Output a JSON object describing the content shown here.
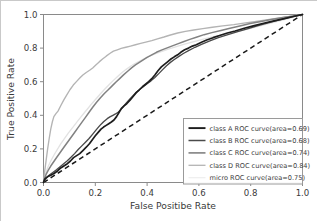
{
  "chart_data": {
    "type": "line",
    "title": "",
    "xlabel": "False Positibe Rate",
    "ylabel": "True Positive Rate",
    "xlim": [
      0.0,
      1.0
    ],
    "ylim": [
      0.0,
      1.0
    ],
    "xticks": [
      "0.0",
      "0.2",
      "0.4",
      "0.6",
      "0.8",
      "1.0"
    ],
    "yticks": [
      "0.0",
      "0.2",
      "0.4",
      "0.6",
      "0.8",
      "1.0"
    ],
    "xtick_values": [
      0.0,
      0.2,
      0.4,
      0.6,
      0.8,
      1.0
    ],
    "ytick_values": [
      0.0,
      0.2,
      0.4,
      0.6,
      0.8,
      1.0
    ],
    "grid": false,
    "legend_position": "lower right",
    "reference_line": {
      "name": "chance-diagonal",
      "style": "dashed",
      "color": "#1a1a1a",
      "x": [
        0.0,
        1.0
      ],
      "y": [
        0.0,
        1.0
      ]
    },
    "series": [
      {
        "name": "class A ROC curve",
        "area": 0.69,
        "color": "#1d1d1d",
        "width": 1.7,
        "x": [
          0.0,
          0.005,
          0.012,
          0.02,
          0.03,
          0.042,
          0.055,
          0.068,
          0.08,
          0.092,
          0.104,
          0.116,
          0.128,
          0.14,
          0.152,
          0.165,
          0.178,
          0.19,
          0.2,
          0.212,
          0.222,
          0.232,
          0.242,
          0.252,
          0.262,
          0.272,
          0.282,
          0.292,
          0.3,
          0.31,
          0.322,
          0.334,
          0.346,
          0.358,
          0.37,
          0.382,
          0.394,
          0.406,
          0.418,
          0.43,
          0.442,
          0.455,
          0.468,
          0.48,
          0.492,
          0.505,
          0.518,
          0.53,
          0.545,
          0.56,
          0.575,
          0.59,
          0.61,
          0.63,
          0.655,
          0.68,
          0.71,
          0.74,
          0.775,
          0.81,
          0.85,
          0.89,
          0.93,
          0.965,
          1.0
        ],
        "y": [
          0.0,
          0.02,
          0.03,
          0.038,
          0.045,
          0.055,
          0.07,
          0.088,
          0.1,
          0.112,
          0.128,
          0.148,
          0.16,
          0.172,
          0.19,
          0.21,
          0.232,
          0.258,
          0.278,
          0.3,
          0.318,
          0.33,
          0.34,
          0.35,
          0.36,
          0.372,
          0.392,
          0.418,
          0.44,
          0.455,
          0.47,
          0.49,
          0.512,
          0.535,
          0.552,
          0.57,
          0.585,
          0.6,
          0.618,
          0.64,
          0.665,
          0.688,
          0.705,
          0.72,
          0.735,
          0.748,
          0.76,
          0.775,
          0.79,
          0.8,
          0.812,
          0.82,
          0.835,
          0.848,
          0.862,
          0.875,
          0.89,
          0.902,
          0.918,
          0.932,
          0.948,
          0.962,
          0.975,
          0.988,
          1.0
        ]
      },
      {
        "name": "class B ROC curve",
        "area": 0.68,
        "color": "#4a4a4a",
        "width": 1.35,
        "x": [
          0.0,
          0.006,
          0.014,
          0.024,
          0.036,
          0.05,
          0.064,
          0.078,
          0.092,
          0.106,
          0.12,
          0.134,
          0.148,
          0.162,
          0.176,
          0.19,
          0.204,
          0.218,
          0.232,
          0.246,
          0.258,
          0.268,
          0.278,
          0.288,
          0.298,
          0.31,
          0.325,
          0.34,
          0.355,
          0.37,
          0.385,
          0.4,
          0.415,
          0.43,
          0.445,
          0.46,
          0.475,
          0.49,
          0.505,
          0.52,
          0.54,
          0.56,
          0.585,
          0.61,
          0.64,
          0.675,
          0.712,
          0.75,
          0.79,
          0.832,
          0.875,
          0.915,
          0.958,
          1.0
        ],
        "y": [
          0.0,
          0.018,
          0.032,
          0.046,
          0.06,
          0.076,
          0.094,
          0.112,
          0.13,
          0.15,
          0.172,
          0.196,
          0.218,
          0.24,
          0.262,
          0.288,
          0.315,
          0.34,
          0.362,
          0.38,
          0.392,
          0.4,
          0.408,
          0.418,
          0.432,
          0.455,
          0.482,
          0.508,
          0.532,
          0.552,
          0.57,
          0.588,
          0.605,
          0.625,
          0.648,
          0.672,
          0.695,
          0.715,
          0.732,
          0.748,
          0.768,
          0.785,
          0.805,
          0.822,
          0.842,
          0.862,
          0.88,
          0.898,
          0.916,
          0.936,
          0.954,
          0.97,
          0.986,
          1.0
        ]
      },
      {
        "name": "class C ROC curve",
        "area": 0.74,
        "color": "#828282",
        "width": 1.5,
        "x": [
          0.0,
          0.004,
          0.01,
          0.018,
          0.028,
          0.04,
          0.052,
          0.065,
          0.078,
          0.092,
          0.106,
          0.12,
          0.134,
          0.148,
          0.162,
          0.176,
          0.19,
          0.205,
          0.22,
          0.235,
          0.25,
          0.265,
          0.28,
          0.295,
          0.31,
          0.325,
          0.34,
          0.355,
          0.37,
          0.385,
          0.4,
          0.418,
          0.436,
          0.455,
          0.475,
          0.495,
          0.518,
          0.54,
          0.565,
          0.59,
          0.62,
          0.65,
          0.685,
          0.72,
          0.758,
          0.798,
          0.84,
          0.88,
          0.92,
          0.96,
          1.0
        ],
        "y": [
          0.0,
          0.025,
          0.048,
          0.072,
          0.098,
          0.125,
          0.152,
          0.18,
          0.208,
          0.238,
          0.268,
          0.298,
          0.328,
          0.358,
          0.388,
          0.418,
          0.448,
          0.478,
          0.505,
          0.53,
          0.552,
          0.575,
          0.598,
          0.62,
          0.642,
          0.662,
          0.682,
          0.7,
          0.715,
          0.73,
          0.745,
          0.76,
          0.775,
          0.788,
          0.8,
          0.812,
          0.825,
          0.838,
          0.852,
          0.865,
          0.88,
          0.892,
          0.905,
          0.918,
          0.932,
          0.946,
          0.958,
          0.97,
          0.98,
          0.99,
          1.0
        ]
      },
      {
        "name": "class D ROC curve",
        "area": 0.84,
        "color": "#b4b4b4",
        "width": 1.35,
        "x": [
          0.0,
          0.004,
          0.01,
          0.016,
          0.022,
          0.028,
          0.034,
          0.04,
          0.048,
          0.056,
          0.066,
          0.078,
          0.09,
          0.102,
          0.115,
          0.128,
          0.14,
          0.152,
          0.165,
          0.178,
          0.19,
          0.202,
          0.215,
          0.228,
          0.242,
          0.256,
          0.27,
          0.285,
          0.3,
          0.318,
          0.336,
          0.355,
          0.375,
          0.395,
          0.418,
          0.44,
          0.465,
          0.49,
          0.518,
          0.548,
          0.58,
          0.615,
          0.652,
          0.692,
          0.735,
          0.78,
          0.828,
          0.878,
          0.93,
          0.965,
          1.0
        ],
        "y": [
          0.0,
          0.06,
          0.13,
          0.2,
          0.262,
          0.318,
          0.36,
          0.392,
          0.41,
          0.425,
          0.455,
          0.49,
          0.522,
          0.552,
          0.58,
          0.602,
          0.622,
          0.64,
          0.655,
          0.668,
          0.682,
          0.7,
          0.718,
          0.735,
          0.752,
          0.768,
          0.782,
          0.79,
          0.798,
          0.805,
          0.812,
          0.82,
          0.828,
          0.836,
          0.845,
          0.855,
          0.866,
          0.878,
          0.89,
          0.9,
          0.908,
          0.916,
          0.924,
          0.932,
          0.94,
          0.95,
          0.96,
          0.972,
          0.984,
          0.992,
          1.0
        ]
      },
      {
        "name": "micro ROC curve",
        "area": 0.75,
        "color": "#e2e2e2",
        "width": 1.3,
        "x": [
          0.0,
          0.004,
          0.01,
          0.018,
          0.028,
          0.04,
          0.053,
          0.066,
          0.08,
          0.095,
          0.11,
          0.125,
          0.14,
          0.156,
          0.172,
          0.188,
          0.204,
          0.22,
          0.236,
          0.252,
          0.268,
          0.284,
          0.3,
          0.318,
          0.336,
          0.355,
          0.375,
          0.395,
          0.416,
          0.438,
          0.46,
          0.485,
          0.51,
          0.538,
          0.566,
          0.596,
          0.628,
          0.662,
          0.698,
          0.736,
          0.776,
          0.818,
          0.862,
          0.908,
          0.955,
          1.0
        ],
        "y": [
          0.0,
          0.03,
          0.062,
          0.095,
          0.128,
          0.162,
          0.196,
          0.228,
          0.26,
          0.292,
          0.322,
          0.352,
          0.382,
          0.412,
          0.442,
          0.472,
          0.5,
          0.528,
          0.555,
          0.58,
          0.605,
          0.628,
          0.65,
          0.672,
          0.692,
          0.71,
          0.726,
          0.742,
          0.756,
          0.77,
          0.782,
          0.795,
          0.808,
          0.82,
          0.832,
          0.845,
          0.858,
          0.87,
          0.882,
          0.895,
          0.908,
          0.925,
          0.942,
          0.96,
          0.98,
          1.0
        ]
      }
    ],
    "legend_entries": [
      {
        "label": "class A ROC curve(area=0.69)",
        "color": "#1d1d1d",
        "width": 1.9
      },
      {
        "label": "class B ROC curve(area=0.68)",
        "color": "#4a4a4a",
        "width": 1.5
      },
      {
        "label": "class C ROC curve(area=0.74)",
        "color": "#828282",
        "width": 1.6
      },
      {
        "label": "class D ROC curve(area=0.84)",
        "color": "#b4b4b4",
        "width": 1.3
      },
      {
        "label": "micro ROC curve(area=0.75)",
        "color": "#eeeeee",
        "width": 1.2
      }
    ]
  },
  "colors": {
    "background": "#ffffff",
    "axis": "#8a8a8a",
    "text": "#3a3a3a",
    "legend_border": "#9a9a9a"
  }
}
